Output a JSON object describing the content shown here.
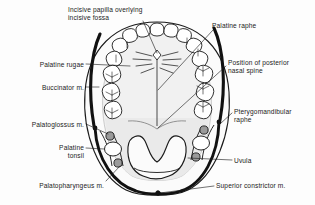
{
  "figure": {
    "colors": {
      "ink": "#1b1b1b",
      "muscle_dark": "#141414",
      "palate_fill": "#f2f2f2",
      "soft_palate_fill": "#e9e9e9",
      "tooth_fill": "#ffffff",
      "tonsil_fill": "#ffffff",
      "muscle_section_fill": "#9a9a9a",
      "background": "#fdfdfd"
    },
    "labels": [
      {
        "id": "incisive-papilla",
        "text": "Incisive papilla overlying\nincisive fossa",
        "side": "left",
        "x": 68,
        "y": 6,
        "w": 96,
        "align": "left"
      },
      {
        "id": "palatine-raphe",
        "text": "Palatine raphe",
        "side": "right",
        "x": 212,
        "y": 22,
        "w": 70,
        "align": "left"
      },
      {
        "id": "palatine-rugae",
        "text": "Palatine rugae",
        "side": "left",
        "x": 12,
        "y": 61,
        "w": 72,
        "align": "right"
      },
      {
        "id": "posterior-nasal-spine",
        "text": "Position of posterior\nnasal spine",
        "side": "right",
        "x": 228,
        "y": 59,
        "w": 86,
        "align": "left"
      },
      {
        "id": "buccinator",
        "text": "Buccinator m.",
        "side": "left",
        "x": 13,
        "y": 84,
        "w": 71,
        "align": "right"
      },
      {
        "id": "pterygomandibular-raphe",
        "text": "Pterygomandibular\nraphe",
        "side": "right",
        "x": 234,
        "y": 108,
        "w": 80,
        "align": "left"
      },
      {
        "id": "palatoglossus",
        "text": "Palatoglossus m.",
        "side": "left",
        "x": 5,
        "y": 121,
        "w": 79,
        "align": "right"
      },
      {
        "id": "palatine-tonsil",
        "text": "Palatine\ntonsil",
        "side": "left",
        "x": 36,
        "y": 144,
        "w": 48,
        "align": "right"
      },
      {
        "id": "uvula",
        "text": "Uvula",
        "side": "right",
        "x": 234,
        "y": 157,
        "w": 40,
        "align": "left"
      },
      {
        "id": "palatopharyngeus",
        "text": "Palatopharyngeus m.",
        "side": "left",
        "x": 8,
        "y": 182,
        "w": 96,
        "align": "right"
      },
      {
        "id": "superior-constrictor",
        "text": "Superior constrictor m.",
        "side": "right",
        "x": 216,
        "y": 182,
        "w": 99,
        "align": "left"
      }
    ],
    "structures": [
      {
        "id": "dental-arch",
        "name": "maxillary dental arch",
        "tooth_count": 16
      },
      {
        "id": "hard-palate",
        "name": "hard palate"
      },
      {
        "id": "soft-palate",
        "name": "soft palate"
      },
      {
        "id": "median-raphe",
        "name": "palatine raphe midline"
      },
      {
        "id": "incisive-papilla-mark",
        "name": "incisive papilla"
      },
      {
        "id": "rugae-lines",
        "name": "palatine rugae",
        "count": 8
      },
      {
        "id": "buccinator-arc-left",
        "name": "buccinator muscle left"
      },
      {
        "id": "buccinator-arc-right",
        "name": "buccinator muscle right"
      },
      {
        "id": "constrictor-arc",
        "name": "superior constrictor muscle"
      },
      {
        "id": "tonsil-left",
        "name": "left palatine tonsil"
      },
      {
        "id": "tonsil-right",
        "name": "right palatine tonsil"
      },
      {
        "id": "uvula-shape",
        "name": "uvula"
      }
    ]
  }
}
